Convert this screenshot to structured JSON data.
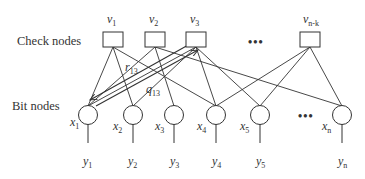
{
  "diagram": {
    "type": "tanner-graph",
    "row_labels": {
      "check": "Check nodes",
      "bit": "Bit nodes"
    },
    "check_nodes": [
      {
        "id": "v1",
        "name": "v",
        "sub": "1"
      },
      {
        "id": "v2",
        "name": "v",
        "sub": "2"
      },
      {
        "id": "v3",
        "name": "v",
        "sub": "3"
      },
      {
        "id": "vnk",
        "name": "v",
        "sub": "n-k"
      }
    ],
    "bit_nodes": [
      {
        "id": "x1",
        "name": "x",
        "sub": "1"
      },
      {
        "id": "x2",
        "name": "x",
        "sub": "2"
      },
      {
        "id": "x3",
        "name": "x",
        "sub": "3"
      },
      {
        "id": "x4",
        "name": "x",
        "sub": "4"
      },
      {
        "id": "x5",
        "name": "x",
        "sub": "5"
      },
      {
        "id": "xn",
        "name": "x",
        "sub": "n"
      }
    ],
    "outputs": [
      {
        "id": "y1",
        "name": "y",
        "sub": "1"
      },
      {
        "id": "y2",
        "name": "y",
        "sub": "2"
      },
      {
        "id": "y3",
        "name": "y",
        "sub": "3"
      },
      {
        "id": "y4",
        "name": "y",
        "sub": "4"
      },
      {
        "id": "y5",
        "name": "y",
        "sub": "5"
      },
      {
        "id": "yn",
        "name": "y",
        "sub": "n"
      }
    ],
    "edges": [
      [
        "v1",
        "x1"
      ],
      [
        "v1",
        "x2"
      ],
      [
        "v1",
        "x4"
      ],
      [
        "v2",
        "x1"
      ],
      [
        "v2",
        "x3"
      ],
      [
        "v2",
        "xn"
      ],
      [
        "v3",
        "x1"
      ],
      [
        "v3",
        "x2"
      ],
      [
        "v3",
        "x4"
      ],
      [
        "v3",
        "x5"
      ],
      [
        "vnk",
        "x4"
      ],
      [
        "vnk",
        "x5"
      ],
      [
        "vnk",
        "xn"
      ]
    ],
    "messages": [
      {
        "name": "r",
        "sub": "13",
        "direction": "v3 -> x1"
      },
      {
        "name": "q",
        "sub": "13",
        "direction": "x1 -> v3"
      }
    ],
    "ellipsis": "•••"
  }
}
